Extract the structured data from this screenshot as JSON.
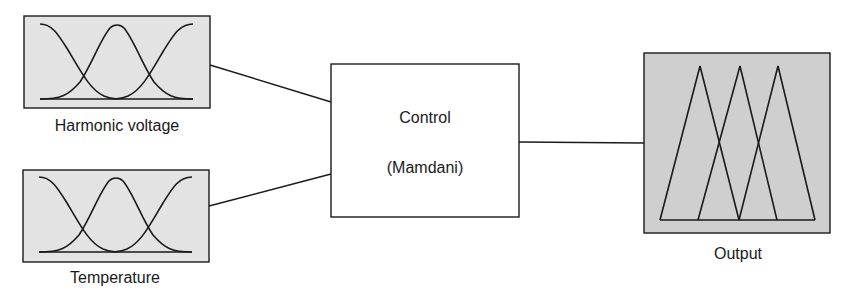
{
  "diagram": {
    "type": "fuzzy-inference-system",
    "inputs": [
      {
        "label": "Harmonic voltage",
        "membership_functions": 3,
        "shape": "gaussian"
      },
      {
        "label": "Temperature",
        "membership_functions": 3,
        "shape": "gaussian"
      }
    ],
    "controller": {
      "line1": "Control",
      "line2": "(Mamdani)"
    },
    "output": {
      "label": "Output",
      "membership_functions": 3,
      "shape": "triangular"
    },
    "colors": {
      "mf_box_fill": "#e3e3e3",
      "output_box_fill": "#cfcfcf",
      "stroke": "#1a1a1a",
      "controller_fill": "#ffffff"
    },
    "edges": [
      {
        "from": "Harmonic voltage",
        "to": "Control (Mamdani)"
      },
      {
        "from": "Temperature",
        "to": "Control (Mamdani)"
      },
      {
        "from": "Control (Mamdani)",
        "to": "Output"
      }
    ]
  }
}
